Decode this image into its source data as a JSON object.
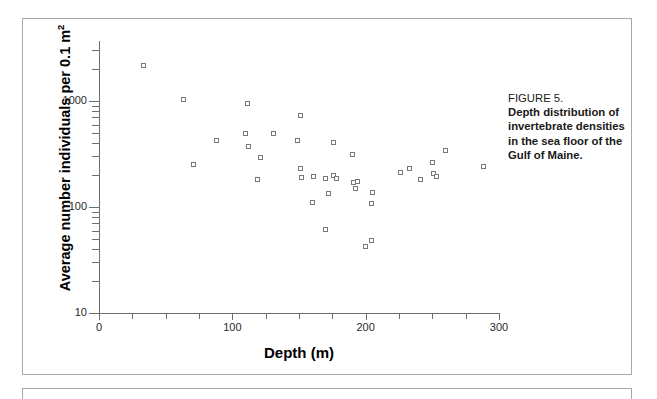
{
  "figure": {
    "caption_label": "FIGURE 5.",
    "caption_body": "Depth distribution of invertebrate densities in the sea floor of the Gulf of Maine."
  },
  "chart_data": {
    "type": "scatter",
    "title": "",
    "xlabel": "Depth (m)",
    "ylabel": "Average number individuals per 0.1 m²",
    "ylabel_plain": "Average number individuals per 0.1 m2",
    "yscale": "log",
    "xscale": "linear",
    "xlim": [
      0,
      300
    ],
    "ylim": [
      10,
      2600
    ],
    "grid": false,
    "legend": "none",
    "x_tick_labels": [
      "0",
      "100",
      "200",
      "300"
    ],
    "x_major_ticks": [
      0,
      100,
      200,
      300
    ],
    "x_minor_tick_step": 25,
    "y_tick_labels": [
      "10",
      "100",
      "1000"
    ],
    "y_major_ticks": [
      10,
      100,
      1000
    ],
    "marker": "open-square",
    "marker_color": "#77777c",
    "points": [
      {
        "x": 33,
        "y": 2150
      },
      {
        "x": 63,
        "y": 1030
      },
      {
        "x": 71,
        "y": 250
      },
      {
        "x": 88,
        "y": 420
      },
      {
        "x": 110,
        "y": 495
      },
      {
        "x": 111,
        "y": 940
      },
      {
        "x": 112,
        "y": 375
      },
      {
        "x": 119,
        "y": 180
      },
      {
        "x": 121,
        "y": 290
      },
      {
        "x": 131,
        "y": 490
      },
      {
        "x": 149,
        "y": 425
      },
      {
        "x": 151,
        "y": 730
      },
      {
        "x": 151,
        "y": 230
      },
      {
        "x": 152,
        "y": 190
      },
      {
        "x": 160,
        "y": 110
      },
      {
        "x": 161,
        "y": 192
      },
      {
        "x": 170,
        "y": 185
      },
      {
        "x": 170,
        "y": 62
      },
      {
        "x": 172,
        "y": 135
      },
      {
        "x": 176,
        "y": 200
      },
      {
        "x": 176,
        "y": 405
      },
      {
        "x": 178,
        "y": 185
      },
      {
        "x": 190,
        "y": 310
      },
      {
        "x": 191,
        "y": 170
      },
      {
        "x": 192,
        "y": 150
      },
      {
        "x": 194,
        "y": 175
      },
      {
        "x": 200,
        "y": 42
      },
      {
        "x": 204,
        "y": 48
      },
      {
        "x": 204,
        "y": 108
      },
      {
        "x": 205,
        "y": 138
      },
      {
        "x": 226,
        "y": 210
      },
      {
        "x": 233,
        "y": 230
      },
      {
        "x": 241,
        "y": 180
      },
      {
        "x": 250,
        "y": 265
      },
      {
        "x": 251,
        "y": 205
      },
      {
        "x": 253,
        "y": 192
      },
      {
        "x": 260,
        "y": 340
      },
      {
        "x": 288,
        "y": 240
      }
    ]
  }
}
